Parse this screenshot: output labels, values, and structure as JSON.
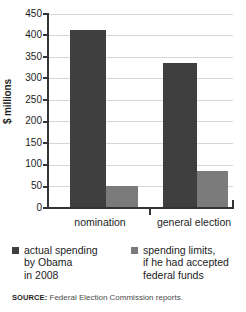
{
  "chart_data": {
    "type": "bar",
    "title": "",
    "xlabel": "",
    "ylabel": "$ millions",
    "ylim": [
      0,
      450
    ],
    "yticks": [
      0,
      50,
      100,
      150,
      200,
      250,
      300,
      350,
      400,
      450
    ],
    "ytick_labels": [
      "0",
      "50",
      "100",
      "150",
      "200",
      "250",
      "300",
      "350",
      "400",
      "450"
    ],
    "grid": true,
    "legend_position": "below",
    "categories": [
      "nomination",
      "general election"
    ],
    "series": [
      {
        "name": "actual spending by Obama in 2008",
        "color": "#3f3f3f",
        "values": [
          412,
          337
        ]
      },
      {
        "name": "spending limits, if he had accepted federal funds",
        "color": "#7b7b7b",
        "values": [
          50,
          86
        ]
      }
    ]
  },
  "axis": {
    "y_label": "$ millions"
  },
  "legend": {
    "items": [
      {
        "swatch": "dark",
        "line1": "actual spending",
        "line2": "by Obama",
        "line3": "in 2008"
      },
      {
        "swatch": "light",
        "line1": "spending limits,",
        "line2": "if he had accepted",
        "line3": "federal funds"
      }
    ]
  },
  "source": {
    "label": "SOURCE:",
    "text": "Federal Election Commission reports."
  }
}
